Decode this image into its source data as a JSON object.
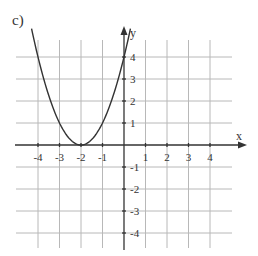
{
  "figure": {
    "label": "c)"
  },
  "chart_data": {
    "type": "line",
    "title": "",
    "panel_label": "c)",
    "xlabel": "x",
    "ylabel": "y",
    "xlim": [
      -4.5,
      5.5
    ],
    "ylim": [
      -4.5,
      5.3
    ],
    "grid": true,
    "x_ticks": [
      -4,
      -3,
      -2,
      -1,
      1,
      2,
      3,
      4
    ],
    "y_ticks": [
      4,
      3,
      2,
      1,
      -1,
      -2,
      -3,
      -4
    ],
    "x_tick_labels": [
      "-4",
      "-3",
      "-2",
      "-1",
      "1",
      "2",
      "3",
      "4"
    ],
    "y_tick_labels": [
      "4",
      "3",
      "2",
      "1",
      "-1",
      "-2",
      "-3",
      "-4"
    ],
    "series": [
      {
        "name": "parabola",
        "function": "y = (x + 2)^2",
        "x": [
          -4.3,
          -4,
          -3.5,
          -3,
          -2.5,
          -2,
          -1.5,
          -1,
          -0.5,
          0,
          0.3
        ],
        "y": [
          5.29,
          4,
          2.25,
          1,
          0.25,
          0,
          0.25,
          1,
          2.25,
          4,
          5.29
        ],
        "color": "#333333"
      }
    ],
    "annotations": {
      "vertex": [
        -2,
        0
      ],
      "y_intercept": [
        0,
        4
      ]
    }
  },
  "style": {
    "grid_color": "#b8b8b8",
    "axis_color": "#333333",
    "curve_color": "#333333",
    "text_color": "#333333"
  }
}
